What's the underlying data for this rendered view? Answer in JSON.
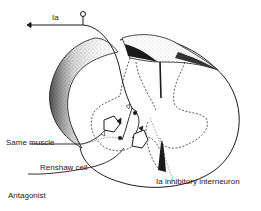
{
  "diagram": {
    "type": "spinal-cord-cross-section",
    "colors": {
      "ink": "#1a1a1a",
      "stipple": "#9a9a9a",
      "background": "#ffffff"
    },
    "labels": {
      "ia_afferent": "Ia",
      "same_muscle": "Same muscle",
      "renshaw_cell": "Renshaw cell",
      "antagonist": "Antagonist",
      "ia_inhibitory_interneuron": "Ia inhibitory interneuron"
    }
  }
}
